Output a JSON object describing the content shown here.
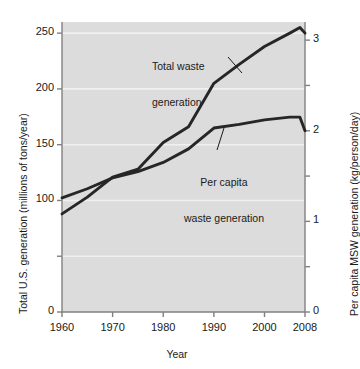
{
  "chart_data": {
    "type": "line",
    "title": "",
    "xlabel": "Year",
    "ylabel": "Total U.S. generation (millions of tons/year)",
    "ylabel_right": "Per capita MSW generation (kg/person/day)",
    "xlim": [
      1960,
      2008
    ],
    "ylim": [
      0,
      260
    ],
    "ylim_right": [
      0,
      3.2
    ],
    "grid": true,
    "grid_orientation": "horizontal",
    "legend_position": "inline-annotations",
    "xticks": [
      1960,
      1970,
      1980,
      1990,
      2000,
      2008
    ],
    "xtick_labels": [
      "1960",
      "1970",
      "1980",
      "1990",
      "2000",
      "2008"
    ],
    "yticks_left": [
      0,
      50,
      100,
      150,
      200,
      250
    ],
    "ytick_labels_left": [
      "0",
      "",
      "100",
      "150",
      "200",
      "250"
    ],
    "yticks_right": [
      0,
      0.5,
      1,
      1.5,
      2,
      2.5,
      3
    ],
    "ytick_labels_right": [
      "0",
      "",
      "1",
      "",
      "2",
      "",
      "3"
    ],
    "series": [
      {
        "name": "Total waste generation",
        "axis": "left",
        "units": "millions of tons/year",
        "x": [
          1960,
          1965,
          1970,
          1975,
          1980,
          1985,
          1990,
          1995,
          2000,
          2005,
          2007,
          2008
        ],
        "values": [
          88,
          103,
          121,
          128,
          152,
          166,
          205,
          222,
          238,
          250,
          255,
          250
        ]
      },
      {
        "name": "Per capita waste generation",
        "axis": "right",
        "units": "kg/person/day",
        "x": [
          1960,
          1965,
          1970,
          1975,
          1980,
          1985,
          1990,
          1995,
          2000,
          2005,
          2007,
          2008
        ],
        "values": [
          1.26,
          1.36,
          1.48,
          1.55,
          1.65,
          1.8,
          2.03,
          2.07,
          2.12,
          2.15,
          2.15,
          2.0
        ],
        "values_left_scale": [
          104,
          112,
          122,
          128,
          136,
          148,
          167,
          170,
          174,
          176,
          176,
          164
        ]
      }
    ],
    "annotations": [
      {
        "name": "total-waste-label",
        "line1": "Total waste",
        "line2": "generation"
      },
      {
        "name": "per-capita-label",
        "line1": "Per capita",
        "line2": "waste generation"
      }
    ],
    "colors": {
      "plot_background": "#dcdcdc",
      "grid": "#f0f0f0",
      "line": "#262626",
      "axis": "#808080",
      "text": "#1a1a1a",
      "page_background": "#ffffff"
    }
  }
}
